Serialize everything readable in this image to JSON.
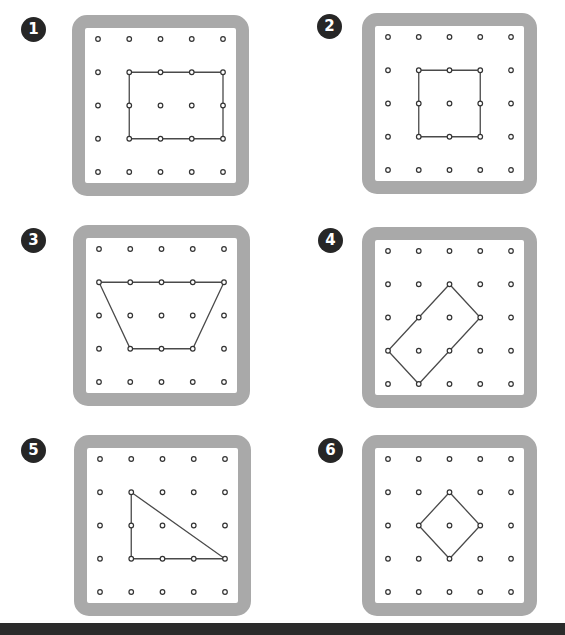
{
  "colors": {
    "frame": "#a9a9a9",
    "badge": "#262626",
    "peg": "#333333",
    "band": "#4a4a4a",
    "bottom_strip": "#2b2b2b"
  },
  "grid": {
    "rows": 5,
    "cols": 5
  },
  "boards": [
    {
      "number": "1",
      "shape": "rectangle",
      "vertices": [
        [
          1,
          1
        ],
        [
          4,
          1
        ],
        [
          4,
          3
        ],
        [
          1,
          3
        ]
      ]
    },
    {
      "number": "2",
      "shape": "square",
      "vertices": [
        [
          1,
          1
        ],
        [
          3,
          1
        ],
        [
          3,
          3
        ],
        [
          1,
          3
        ]
      ]
    },
    {
      "number": "3",
      "shape": "trapezoid",
      "vertices": [
        [
          0,
          1
        ],
        [
          4,
          1
        ],
        [
          3,
          3
        ],
        [
          1,
          3
        ]
      ]
    },
    {
      "number": "4",
      "shape": "rotated-rectangle",
      "vertices": [
        [
          2,
          1
        ],
        [
          3,
          2
        ],
        [
          1,
          4
        ],
        [
          0,
          3
        ]
      ]
    },
    {
      "number": "5",
      "shape": "right-triangle",
      "vertices": [
        [
          1,
          1
        ],
        [
          4,
          3
        ],
        [
          1,
          3
        ]
      ]
    },
    {
      "number": "6",
      "shape": "rotated-square",
      "vertices": [
        [
          2,
          1
        ],
        [
          3,
          2
        ],
        [
          2,
          3
        ],
        [
          1,
          2
        ]
      ]
    }
  ]
}
